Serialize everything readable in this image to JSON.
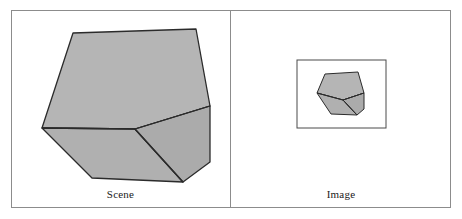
{
  "figure": {
    "width": 462,
    "height": 219,
    "background_color": "#ffffff",
    "frame_color": "#8c8c8c"
  },
  "panels": [
    {
      "id": "scene",
      "caption": "Scene",
      "content": "large-shaded-cube"
    },
    {
      "id": "image",
      "caption": "Image",
      "content": "small-shaded-cube-inside-image-plane-rectangle"
    }
  ],
  "cube_style": {
    "top_face_color": "#b5b5b5",
    "left_face_color": "#b0b0b0",
    "right_face_color": "#ababab",
    "edge_color": "#2b2b2b",
    "edge_width": 1.3
  },
  "scene_cube": {
    "label": "large-cube",
    "vertices": {
      "apex_top": [
        196,
        29
      ],
      "top_left": [
        73,
        33
      ],
      "right": [
        210,
        106
      ],
      "left": [
        42,
        128
      ],
      "center": [
        135,
        129
      ],
      "bottom_left": [
        92,
        178
      ],
      "bottom_right": [
        183,
        182
      ]
    },
    "faces": {
      "top": [
        [
          73,
          33
        ],
        [
          196,
          29
        ],
        [
          210,
          106
        ],
        [
          135,
          129
        ],
        [
          42,
          128
        ]
      ],
      "left": [
        [
          42,
          128
        ],
        [
          135,
          129
        ],
        [
          183,
          182
        ],
        [
          92,
          178
        ]
      ],
      "right": [
        [
          135,
          129
        ],
        [
          210,
          106
        ],
        [
          210,
          106
        ],
        [
          183,
          182
        ]
      ]
    }
  },
  "image_plane": {
    "label": "image-plane-rectangle",
    "x": 297,
    "y": 60,
    "width": 89,
    "height": 68,
    "border_color": "#4a4a4a"
  },
  "image_cube": {
    "label": "small-cube",
    "vertices": {
      "apex_top": [
        358,
        72
      ],
      "top_left": [
        325,
        74
      ],
      "right": [
        365,
        94
      ],
      "left": [
        317,
        93
      ],
      "center": [
        343,
        100
      ],
      "bottom_left": [
        325,
        114
      ],
      "bottom_right": [
        357,
        115
      ]
    }
  }
}
